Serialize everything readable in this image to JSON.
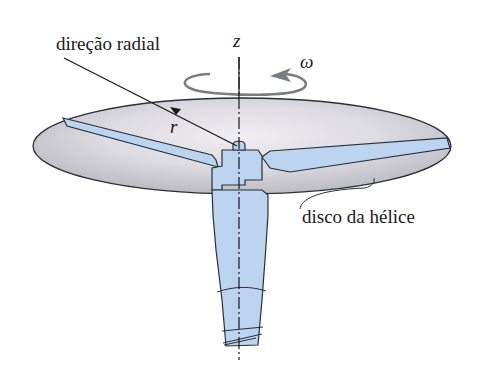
{
  "labels": {
    "radial_direction": "direção radial",
    "axis_z": "z",
    "angular_velocity": "ω",
    "radius": "r",
    "propeller_disk": "disco da hélice"
  },
  "colors": {
    "disk_fill_center": "#e6e4ea",
    "disk_fill_edge": "#c4c2c8",
    "blade_fill": "#bcd4ef",
    "outline": "#2a2f3a",
    "arrow_gray": "#7a7d80",
    "text": "#1a1a1a"
  }
}
